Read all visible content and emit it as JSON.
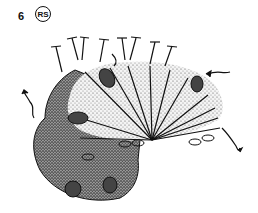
{
  "figure": {
    "step_number": "6",
    "side_label": "RS"
  },
  "colors": {
    "ink": "#111111",
    "light_shade": "#d9d9d9",
    "dark_shade": "#7a7a7a",
    "background": "#ffffff"
  }
}
